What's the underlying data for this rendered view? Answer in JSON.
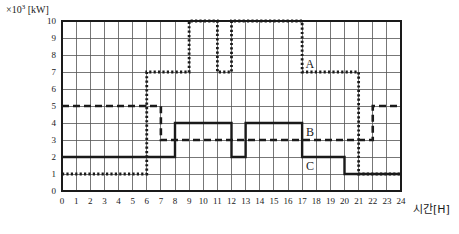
{
  "axis": {
    "y_unit_prefix": "×10",
    "y_unit_exp": "3",
    "y_unit_suffix": " [kW]",
    "y_unit_label": "×10³ [kW]",
    "x_title": "시간[H]",
    "y_ticks": [
      "0",
      "1",
      "2",
      "3",
      "4",
      "5",
      "6",
      "7",
      "8",
      "9",
      "10"
    ],
    "x_ticks": [
      "0",
      "1",
      "2",
      "3",
      "4",
      "5",
      "6",
      "7",
      "8",
      "9",
      "10",
      "11",
      "12",
      "13",
      "14",
      "15",
      "16",
      "17",
      "18",
      "19",
      "20",
      "21",
      "22",
      "23",
      "24"
    ]
  },
  "labels": {
    "curve_a": "A",
    "curve_b": "B",
    "curve_c": "C"
  },
  "colors": {
    "ink": "#1a1a1a",
    "grid": "#555555",
    "background": "#ffffff"
  },
  "chart_data": {
    "type": "line",
    "title": "",
    "xlabel": "시간[H]",
    "ylabel": "×10³ [kW]",
    "xlim": [
      0,
      24
    ],
    "ylim": [
      0,
      10
    ],
    "grid": true,
    "legend": "inline-annotations",
    "x": [
      0,
      1,
      2,
      3,
      4,
      5,
      6,
      7,
      8,
      9,
      10,
      11,
      12,
      13,
      14,
      15,
      16,
      17,
      18,
      19,
      20,
      21,
      22,
      23,
      24
    ],
    "series": [
      {
        "name": "A",
        "style": "dotted",
        "steps": [
          {
            "from": 0,
            "to": 6,
            "value": 1
          },
          {
            "from": 6,
            "to": 9,
            "value": 7
          },
          {
            "from": 9,
            "to": 11,
            "value": 10
          },
          {
            "from": 11,
            "to": 12,
            "value": 7
          },
          {
            "from": 12,
            "to": 17,
            "value": 10
          },
          {
            "from": 17,
            "to": 21,
            "value": 7
          },
          {
            "from": 21,
            "to": 24,
            "value": 1
          }
        ],
        "values": [
          1,
          1,
          1,
          1,
          1,
          1,
          7,
          7,
          7,
          10,
          10,
          7,
          10,
          10,
          10,
          10,
          10,
          7,
          7,
          7,
          7,
          1,
          1,
          1,
          1
        ]
      },
      {
        "name": "B",
        "style": "dashed",
        "steps": [
          {
            "from": 0,
            "to": 7,
            "value": 5
          },
          {
            "from": 7,
            "to": 22,
            "value": 3
          },
          {
            "from": 22,
            "to": 24,
            "value": 5
          }
        ],
        "values": [
          5,
          5,
          5,
          5,
          5,
          5,
          5,
          3,
          3,
          3,
          3,
          3,
          3,
          3,
          3,
          3,
          3,
          3,
          3,
          3,
          3,
          3,
          5,
          5,
          5
        ]
      },
      {
        "name": "C",
        "style": "solid",
        "steps": [
          {
            "from": 0,
            "to": 8,
            "value": 2
          },
          {
            "from": 8,
            "to": 12,
            "value": 4
          },
          {
            "from": 12,
            "to": 13,
            "value": 2
          },
          {
            "from": 13,
            "to": 17,
            "value": 4
          },
          {
            "from": 17,
            "to": 20,
            "value": 2
          },
          {
            "from": 20,
            "to": 24,
            "value": 1
          }
        ],
        "values": [
          2,
          2,
          2,
          2,
          2,
          2,
          2,
          2,
          4,
          4,
          4,
          4,
          2,
          4,
          4,
          4,
          4,
          2,
          2,
          2,
          1,
          1,
          1,
          1,
          1
        ]
      }
    ]
  }
}
